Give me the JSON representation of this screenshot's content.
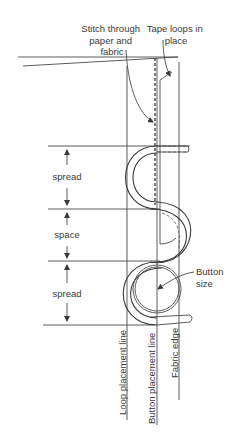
{
  "diagram": {
    "labels": {
      "stitch": [
        "Stitch through",
        "paper and",
        "fabric"
      ],
      "tape_loops": [
        "Tape loops in",
        "place"
      ],
      "spread_1": "spread",
      "space": "space",
      "spread_2": "spread",
      "button_size": [
        "Button",
        "size"
      ],
      "loop_line": "Loop placement line",
      "button_line": "Button placement line",
      "fabric_edge": "Fabric edge"
    },
    "colors": {
      "line": "#4a4a4a",
      "text": "#3a3a3a",
      "background": "#ffffff"
    }
  }
}
